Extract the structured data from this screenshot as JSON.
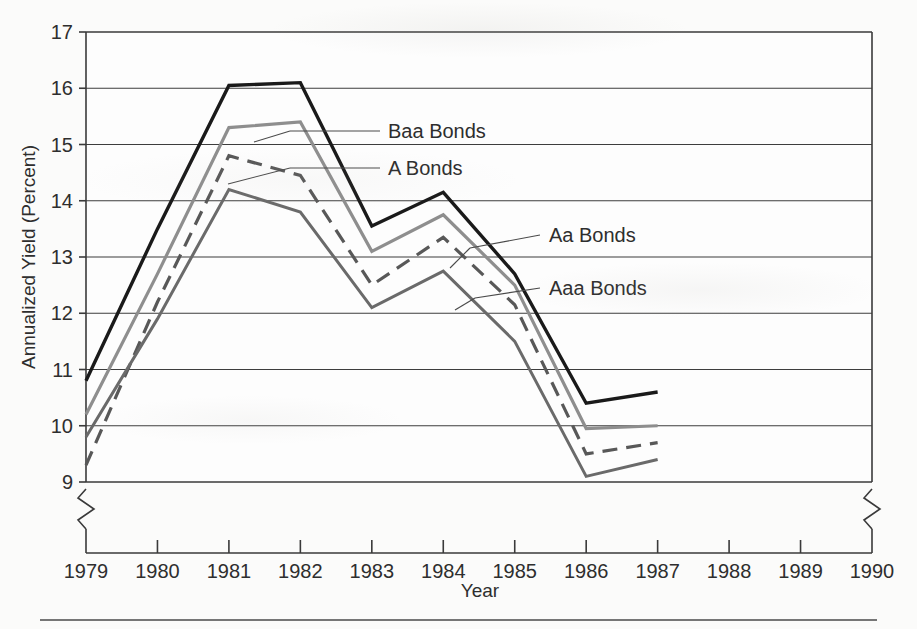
{
  "chart_data": {
    "type": "line",
    "title": "",
    "xlabel": "Year",
    "ylabel": "Annualized Yield (Percent)",
    "x": [
      1979,
      1980,
      1981,
      1982,
      1983,
      1984,
      1985,
      1986,
      1987
    ],
    "xlim": [
      1979,
      1990
    ],
    "ylim": [
      9,
      17
    ],
    "xticks": [
      "1979",
      "1980",
      "1981",
      "1982",
      "1983",
      "1984",
      "1985",
      "1986",
      "1987",
      "1988",
      "1989",
      "1990"
    ],
    "yticks": [
      "9",
      "10",
      "11",
      "12",
      "13",
      "14",
      "15",
      "16",
      "17"
    ],
    "grid": "horizontal",
    "axis_break_y": true,
    "axis_break_x_right": true,
    "legend_position": "inline-labels",
    "series": [
      {
        "name": "Baa Bonds",
        "color": "#1a1a1a",
        "style": "solid",
        "width": 3.4,
        "values": [
          10.8,
          13.5,
          16.05,
          16.1,
          13.55,
          14.15,
          12.7,
          10.4,
          10.6
        ]
      },
      {
        "name": "A Bonds",
        "color": "#8e8e8e",
        "style": "solid",
        "width": 3.2,
        "values": [
          10.2,
          12.7,
          15.3,
          15.4,
          13.1,
          13.75,
          12.5,
          9.95,
          10.0
        ]
      },
      {
        "name": "Aa Bonds",
        "color": "#585858",
        "style": "dashed",
        "width": 3.2,
        "values": [
          9.3,
          12.2,
          14.8,
          14.45,
          12.5,
          13.35,
          12.15,
          9.5,
          9.7
        ]
      },
      {
        "name": "Aaa Bonds",
        "color": "#6a6a6a",
        "style": "solid",
        "width": 3.0,
        "values": [
          9.8,
          11.9,
          14.2,
          13.8,
          12.1,
          12.75,
          11.5,
          9.1,
          9.4
        ]
      }
    ],
    "annotations": [
      {
        "text": "Baa Bonds",
        "x": 388,
        "y": 131
      },
      {
        "text": "A Bonds",
        "x": 388,
        "y": 168
      },
      {
        "text": "Aa Bonds",
        "x": 549,
        "y": 235
      },
      {
        "text": "Aaa Bonds",
        "x": 549,
        "y": 288
      }
    ]
  },
  "footer": {
    "rule": ""
  }
}
